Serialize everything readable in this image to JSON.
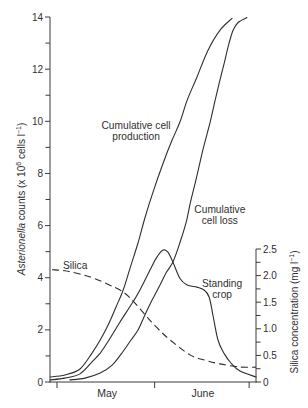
{
  "chart_data": {
    "type": "line",
    "title": "",
    "xlabel": "",
    "x_unit": "days from 1 May",
    "xlim": [
      -2.2,
      63.2
    ],
    "x_tick_positions": [
      0,
      31,
      61
    ],
    "x_categories": [
      {
        "label": "May",
        "center": 15.9
      },
      {
        "label": "June",
        "center": 46.3
      }
    ],
    "ylabel": "Asterionella counts (x 10^6 cells l^-1)",
    "ylabel_parts": {
      "italic": "Asterionella",
      "text1": " counts (x 10",
      "sup1": "6",
      "text2": " cells l",
      "sup2": "−1",
      "text3": ")"
    },
    "ylim": [
      0,
      14
    ],
    "yticks": [
      0,
      2,
      4,
      6,
      8,
      10,
      12,
      14
    ],
    "ytick_labels": [
      "0",
      "2",
      "4",
      "6",
      "8",
      "10",
      "12",
      "14"
    ],
    "yminor_ticks": [
      1,
      3,
      5,
      7,
      9,
      11,
      13
    ],
    "y2label": "Silica concentration (mg l^-1)",
    "y2label_parts": {
      "text1": "Silica concentration (mg l",
      "sup": "−1",
      "text2": ")"
    },
    "y2lim": [
      0,
      2.5
    ],
    "y2ticks": [
      0,
      0.5,
      1.0,
      1.5,
      2.0,
      2.5
    ],
    "y2tick_labels": [
      "0",
      "0.5",
      "1.0",
      "1.5",
      "2.0",
      "2.5"
    ],
    "y2minor_ticks": [
      0.25,
      0.75,
      1.25,
      1.75,
      2.25
    ],
    "grid": false,
    "legend": null,
    "series": [
      {
        "id": "cumulative-cell-production",
        "name": "Cumulative cell production",
        "axis": "left",
        "style": "solid",
        "x": [
          -2.2,
          2.5,
          7.3,
          11.1,
          13.7,
          16.2,
          18.7,
          21.0,
          23.2,
          25.7,
          27.9,
          30.5,
          33.7,
          36.5,
          39.0,
          41.3,
          44.4,
          47.9,
          51.7,
          55.6
        ],
        "y": [
          0.19,
          0.27,
          0.5,
          1.11,
          1.61,
          2.18,
          2.87,
          3.52,
          4.37,
          5.33,
          6.29,
          7.29,
          8.4,
          9.27,
          9.96,
          10.8,
          11.69,
          12.72,
          13.49,
          13.95
        ]
      },
      {
        "id": "cumulative-cell-loss",
        "name": "Cumulative cell loss",
        "axis": "left",
        "style": "solid",
        "x": [
          4.1,
          8.9,
          13.7,
          17.5,
          20.6,
          23.5,
          25.7,
          27.9,
          30.2,
          32.7,
          34.6,
          36.8,
          39.0,
          41.0,
          42.5,
          44.1,
          46.3,
          48.6,
          50.2,
          51.7,
          53.3,
          54.6,
          55.9,
          57.5,
          60.3
        ],
        "y": [
          0.08,
          0.15,
          0.34,
          0.65,
          1.11,
          1.61,
          1.99,
          2.57,
          3.14,
          3.72,
          4.18,
          4.6,
          5.33,
          6.13,
          6.97,
          7.74,
          8.89,
          9.96,
          10.8,
          11.57,
          12.34,
          12.99,
          13.49,
          13.79,
          13.98
        ]
      },
      {
        "id": "standing-crop",
        "name": "Standing crop",
        "axis": "left",
        "style": "solid",
        "x": [
          -2.2,
          2.5,
          7.3,
          11.1,
          13.7,
          16.5,
          20.0,
          24.1,
          26.3,
          29.5,
          31.7,
          33.7,
          35.2,
          36.8,
          39.0,
          41.3,
          44.4,
          46.7,
          48.3,
          49.5,
          51.1,
          53.0,
          55.2,
          58.1,
          63.2
        ],
        "y": [
          0.08,
          0.15,
          0.31,
          0.77,
          1.11,
          1.61,
          2.3,
          3.07,
          3.52,
          4.29,
          4.79,
          5.06,
          4.98,
          4.6,
          3.98,
          3.72,
          3.64,
          3.53,
          3.26,
          2.57,
          1.61,
          1.11,
          0.73,
          0.42,
          0.19
        ]
      },
      {
        "id": "silica",
        "name": "Silica",
        "axis": "right",
        "style": "dashed",
        "x": [
          -1.6,
          2.5,
          7.3,
          12.1,
          16.8,
          20.0,
          23.2,
          27.9,
          31.7,
          35.9,
          42.2,
          47.0,
          51.7,
          58.1,
          63.2
        ],
        "y": [
          2.11,
          2.09,
          2.03,
          1.94,
          1.82,
          1.73,
          1.58,
          1.27,
          1.02,
          0.79,
          0.51,
          0.41,
          0.34,
          0.28,
          0.28
        ]
      }
    ],
    "annotations": [
      {
        "id": "production-label",
        "lines": [
          "Cumulative cell",
          "production"
        ],
        "x": 25.1,
        "y": 9.7,
        "anchor": "middle"
      },
      {
        "id": "loss-label",
        "lines": [
          "Cumulative",
          "cell loss"
        ],
        "x": 51.7,
        "y": 6.48,
        "anchor": "middle"
      },
      {
        "id": "standing-crop-label",
        "lines": [
          "Standing",
          "crop"
        ],
        "x": 52.4,
        "y": 3.64,
        "anchor": "middle"
      },
      {
        "id": "silica-label",
        "lines": [
          "Silica"
        ],
        "x": 1.9,
        "y": 4.33,
        "anchor": "start"
      }
    ]
  }
}
